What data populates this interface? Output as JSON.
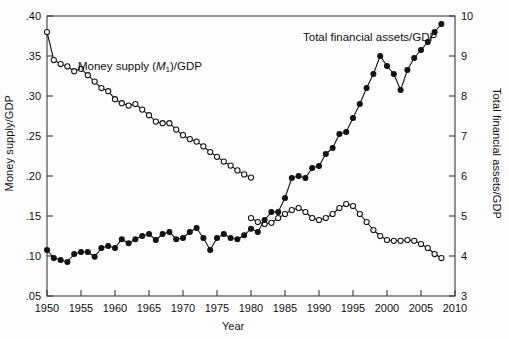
{
  "figure": {
    "xlabel": "Year",
    "ylabel_left": "Money supply/GDP",
    "ylabel_right": "Total financial assets/GDP",
    "label_money_prefix": "Money supply (",
    "label_money_sub": "1",
    "label_money_suffix": ")/GDP",
    "label_assets": "Total financial assets/GDP"
  },
  "chart_data": {
    "type": "line",
    "title": "",
    "xlabel": "Year",
    "ylabel": "Money supply/GDP",
    "ylabel_secondary": "Total financial assets/GDP",
    "xlim": [
      1950,
      2010
    ],
    "xticks": [
      1950,
      1955,
      1960,
      1965,
      1970,
      1975,
      1980,
      1985,
      1990,
      1995,
      2000,
      2005,
      2010
    ],
    "xtick_labels": [
      "1950",
      "1955",
      "1960",
      "1965",
      "1970",
      "1975",
      "1980",
      "1985",
      "1990",
      "1995",
      "2000",
      "2005",
      "2010"
    ],
    "ylim": [
      0.05,
      0.4
    ],
    "yticks": [
      0.05,
      0.1,
      0.15,
      0.2,
      0.25,
      0.3,
      0.35,
      0.4
    ],
    "ytick_labels": [
      ".05",
      ".10",
      ".15",
      ".20",
      ".25",
      ".30",
      ".35",
      ".40"
    ],
    "ylim_secondary": [
      3,
      10
    ],
    "yticks_secondary": [
      3,
      4,
      5,
      6,
      7,
      8,
      9,
      10
    ],
    "ytick_labels_secondary": [
      "3",
      "4",
      "5",
      "6",
      "7",
      "8",
      "9",
      "10"
    ],
    "grid": false,
    "legend_position": "inline-annotation",
    "x": [
      1950,
      1951,
      1952,
      1953,
      1954,
      1955,
      1956,
      1957,
      1958,
      1959,
      1960,
      1961,
      1962,
      1963,
      1964,
      1965,
      1966,
      1967,
      1968,
      1969,
      1970,
      1971,
      1972,
      1973,
      1974,
      1975,
      1976,
      1977,
      1978,
      1979,
      1980,
      1981,
      1982,
      1983,
      1984,
      1985,
      1986,
      1987,
      1988,
      1989,
      1990,
      1991,
      1992,
      1993,
      1994,
      1995,
      1996,
      1997,
      1998,
      1999,
      2000,
      2001,
      2002,
      2003,
      2004,
      2005,
      2006,
      2007,
      2008
    ],
    "series": [
      {
        "name": "Money supply (M1)/GDP",
        "axis": "left",
        "marker": "open-circle",
        "values": [
          0.38,
          0.345,
          0.34,
          0.337,
          0.331,
          0.334,
          0.326,
          0.318,
          0.31,
          0.306,
          0.296,
          0.291,
          0.288,
          0.29,
          0.283,
          0.276,
          0.268,
          0.266,
          0.266,
          0.258,
          0.251,
          0.246,
          0.243,
          0.237,
          0.23,
          0.224,
          0.218,
          0.213,
          0.207,
          0.202,
          0.198,
          0.192,
          0.188,
          0.184,
          0.178,
          0.173,
          0.168,
          0.163,
          0.159,
          0.155,
          0.152,
          0.15,
          0.147,
          0.144,
          0.142,
          0.14,
          0.138,
          0.137,
          0.135,
          0.133,
          0.133,
          0.135,
          0.134,
          0.133,
          0.131,
          0.13,
          0.129,
          0.129,
          0.128
        ]
      },
      {
        "name": "Money supply (M1)/GDP (right-axis scale reading)",
        "axis": "right",
        "marker": "open-circle",
        "note": "same open-circle curve, values shown against secondary axis for the later period",
        "values_secondary": [
          null,
          null,
          null,
          null,
          null,
          null,
          null,
          null,
          null,
          null,
          null,
          null,
          null,
          null,
          null,
          null,
          null,
          null,
          null,
          null,
          null,
          null,
          null,
          null,
          null,
          null,
          null,
          null,
          null,
          null,
          4.95,
          4.85,
          4.8,
          4.83,
          4.95,
          5.05,
          5.15,
          5.2,
          5.1,
          4.95,
          4.9,
          4.95,
          5.05,
          5.2,
          5.3,
          5.25,
          5.05,
          4.85,
          4.65,
          4.5,
          4.4,
          4.38,
          4.38,
          4.4,
          4.38,
          4.3,
          4.2,
          4.05,
          3.95
        ]
      },
      {
        "name": "Total financial assets/GDP",
        "axis": "right",
        "marker": "filled-circle",
        "values": [
          4.15,
          3.95,
          3.9,
          3.85,
          4.05,
          4.1,
          4.1,
          3.98,
          4.2,
          4.25,
          4.2,
          4.42,
          4.32,
          4.42,
          4.5,
          4.55,
          4.4,
          4.55,
          4.6,
          4.42,
          4.45,
          4.6,
          4.7,
          4.45,
          4.15,
          4.45,
          4.55,
          4.45,
          4.42,
          4.52,
          4.68,
          4.6,
          4.9,
          5.1,
          5.1,
          5.45,
          5.95,
          6.0,
          5.95,
          6.2,
          6.25,
          6.55,
          6.7,
          7.05,
          7.1,
          7.45,
          7.8,
          8.2,
          8.55,
          9.0,
          8.75,
          8.55,
          8.15,
          8.65,
          8.95,
          9.15,
          9.35,
          9.6,
          9.8
        ]
      }
    ]
  }
}
